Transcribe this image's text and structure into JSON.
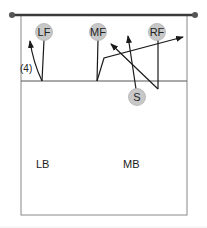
{
  "diagram": {
    "type": "volleyball-court-rotation",
    "colors": {
      "net": "#3a3a3a",
      "court_line": "#888888",
      "player_fill": "#c8c8c8",
      "player_stroke": "#b0b0b0",
      "path": "#1a1a1a",
      "text": "#222222"
    },
    "net": {
      "x1": 12,
      "x2": 195,
      "y": 15
    },
    "court": {
      "left": 21,
      "right": 187,
      "top": 15,
      "bottom": 215,
      "attack_line_y": 81
    },
    "players": [
      {
        "id": "LF",
        "label": "LF",
        "cx": 44,
        "cy": 32
      },
      {
        "id": "MF",
        "label": "MF",
        "cx": 98,
        "cy": 32
      },
      {
        "id": "RF",
        "label": "RF",
        "cx": 157,
        "cy": 32
      },
      {
        "id": "S",
        "label": "S",
        "cx": 137,
        "cy": 97
      }
    ],
    "zones": [
      {
        "label": "LB",
        "x": 36,
        "y": 168
      },
      {
        "label": "MB",
        "x": 123,
        "y": 168
      }
    ],
    "annotations": [
      {
        "label": "(4)",
        "x": 20,
        "y": 72
      }
    ],
    "paths": [
      {
        "from": "LF",
        "desc": "LF drops back to attack line then approaches outside",
        "arrow": true
      },
      {
        "from": "MF",
        "desc": "MF drops back then approaches right",
        "arrow": true
      },
      {
        "from": "S",
        "desc": "Setter moves up to net",
        "arrow": true
      },
      {
        "from": "RF",
        "desc": "RF drops back then crosses toward middle",
        "arrow": true
      }
    ],
    "footer_rule_y": 227
  }
}
